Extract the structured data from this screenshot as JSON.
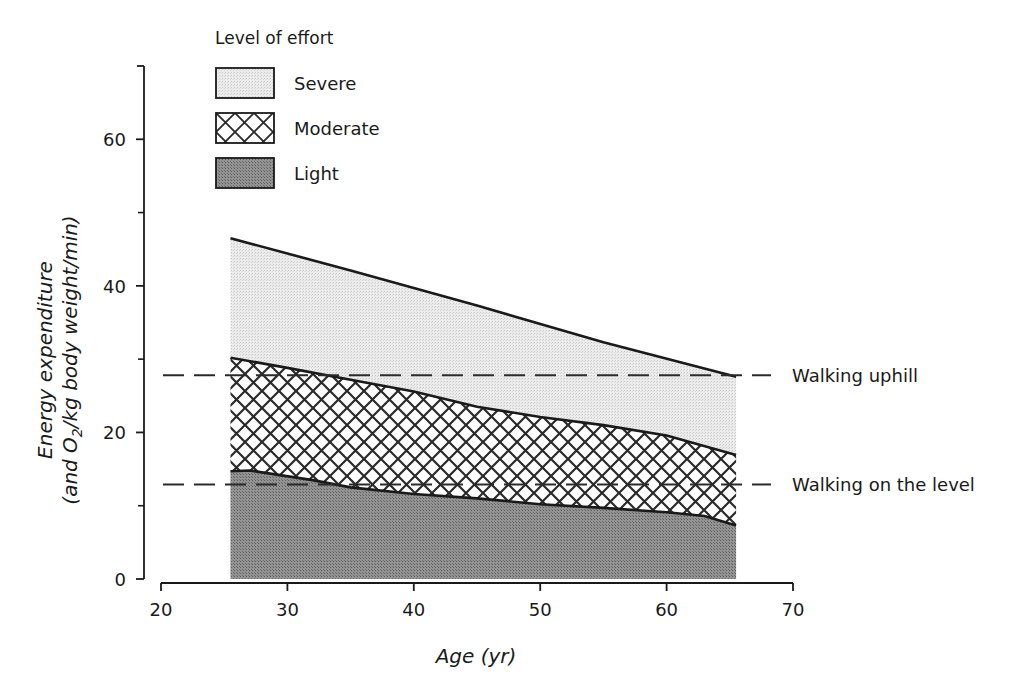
{
  "chart_data": {
    "type": "area",
    "stacked": true,
    "title": "",
    "xlabel": "Age (yr)",
    "ylabel_line1": "Energy expenditure",
    "ylabel_line2_prefix": "(and O",
    "ylabel_line2_sub": "2",
    "ylabel_line2_suffix": "/kg body weight/min)",
    "xlim": [
      20,
      70
    ],
    "ylim": [
      0,
      70
    ],
    "x_ticks": [
      20,
      30,
      40,
      50,
      60,
      70
    ],
    "y_ticks": [
      0,
      20,
      40,
      60
    ],
    "y_minor_ticks": [
      10,
      30,
      50
    ],
    "grid": false,
    "legend": {
      "title": "Level of effort",
      "position": "top-left",
      "entries": [
        {
          "label": "Severe",
          "pattern": "light-stipple"
        },
        {
          "label": "Moderate",
          "pattern": "crosshatch"
        },
        {
          "label": "Light",
          "pattern": "dark-stipple"
        }
      ]
    },
    "series": [
      {
        "name": "Light",
        "upper_bound": [
          [
            25.5,
            14.7
          ],
          [
            27,
            14.8
          ],
          [
            32,
            13.5
          ],
          [
            35,
            12.5
          ],
          [
            40,
            11.6
          ],
          [
            45,
            11.0
          ],
          [
            50,
            10.2
          ],
          [
            55,
            9.7
          ],
          [
            60,
            9.1
          ],
          [
            63,
            8.6
          ],
          [
            65.5,
            7.3
          ]
        ],
        "lower_bound": 0
      },
      {
        "name": "Moderate",
        "upper_bound": [
          [
            25.5,
            30.2
          ],
          [
            30,
            28.8
          ],
          [
            35,
            27.2
          ],
          [
            40,
            25.6
          ],
          [
            45,
            23.5
          ],
          [
            50,
            22.1
          ],
          [
            55,
            21.0
          ],
          [
            60,
            19.6
          ],
          [
            65.5,
            16.9
          ]
        ],
        "lower_bound": "Light"
      },
      {
        "name": "Severe",
        "upper_bound": [
          [
            25.5,
            46.5
          ],
          [
            35,
            42.1
          ],
          [
            45,
            37.3
          ],
          [
            55,
            32.3
          ],
          [
            65.5,
            27.6
          ]
        ],
        "lower_bound": "Moderate"
      }
    ],
    "reference_lines": [
      {
        "label": "Walking uphill",
        "y": 27.8,
        "style": "dashed"
      },
      {
        "label": "Walking on the level",
        "y": 12.9,
        "style": "dashed"
      }
    ]
  },
  "colors": {
    "ink": "#1a1a1a",
    "severe_fill": "#e9e9e9",
    "moderate_fill": "#ffffff",
    "light_fill": "#8c8c8c",
    "background": "#ffffff"
  }
}
